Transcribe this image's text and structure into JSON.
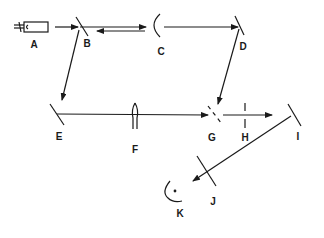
{
  "diagram": {
    "type": "optical-setup",
    "stroke_color": "#1a1a1a",
    "background": "#ffffff",
    "components": [
      {
        "id": "A",
        "label": "A",
        "kind": "laser-source"
      },
      {
        "id": "B",
        "label": "B",
        "kind": "beam-splitter-mirror"
      },
      {
        "id": "C",
        "label": "C",
        "kind": "concave-mirror"
      },
      {
        "id": "D",
        "label": "D",
        "kind": "plane-mirror"
      },
      {
        "id": "E",
        "label": "E",
        "kind": "plane-mirror"
      },
      {
        "id": "F",
        "label": "F",
        "kind": "lens"
      },
      {
        "id": "G",
        "label": "G",
        "kind": "beam-combiner"
      },
      {
        "id": "H",
        "label": "H",
        "kind": "aperture"
      },
      {
        "id": "I",
        "label": "I",
        "kind": "plane-mirror"
      },
      {
        "id": "J",
        "label": "J",
        "kind": "filter"
      },
      {
        "id": "K",
        "label": "K",
        "kind": "detector"
      }
    ],
    "beam_paths": [
      {
        "from": "A",
        "to": "B"
      },
      {
        "from": "B",
        "to": "C"
      },
      {
        "from": "C",
        "to": "B"
      },
      {
        "from": "C",
        "to": "D"
      },
      {
        "from": "D",
        "to": "G"
      },
      {
        "from": "B",
        "to": "E"
      },
      {
        "from": "E",
        "to": "G",
        "via": "F"
      },
      {
        "from": "G",
        "to": "I",
        "via": "H"
      },
      {
        "from": "I",
        "to": "K",
        "via": "J"
      }
    ]
  }
}
